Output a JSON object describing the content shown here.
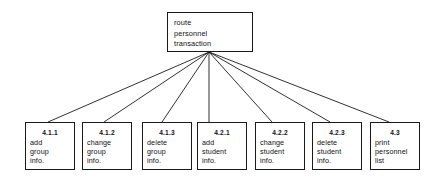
{
  "diagram": {
    "type": "structure-chart",
    "background_color": "#ffffff",
    "line_color": "#1a1a1a",
    "text_color": "#111111",
    "root": {
      "id": "",
      "lines": [
        "route",
        "personnel",
        "transaction"
      ]
    },
    "children": [
      {
        "id": "4.1.1",
        "lines": [
          "add",
          "group",
          "info."
        ]
      },
      {
        "id": "4.1.2",
        "lines": [
          "change",
          "group",
          "info."
        ]
      },
      {
        "id": "4.1.3",
        "lines": [
          "delete",
          "group",
          "info."
        ]
      },
      {
        "id": "4.2.1",
        "lines": [
          "add",
          "student",
          "info."
        ]
      },
      {
        "id": "4.2.2",
        "lines": [
          "change",
          "student",
          "info."
        ]
      },
      {
        "id": "4.2.3",
        "lines": [
          "delete",
          "student",
          "info."
        ]
      },
      {
        "id": "4.3",
        "lines": [
          "print",
          "personnel",
          "list"
        ]
      }
    ],
    "edges": {
      "from_point": {
        "x": 209,
        "y": 52
      },
      "to_points": [
        {
          "x": 48,
          "y": 122
        },
        {
          "x": 104,
          "y": 122
        },
        {
          "x": 162,
          "y": 122
        },
        {
          "x": 209,
          "y": 122
        },
        {
          "x": 272,
          "y": 122
        },
        {
          "x": 330,
          "y": 122
        },
        {
          "x": 389,
          "y": 122
        }
      ]
    },
    "geometry": {
      "root_box": {
        "x": 167,
        "y": 12,
        "w": 86,
        "h": 40
      },
      "child_boxes": [
        {
          "x": 25,
          "y": 122,
          "w": 50,
          "h": 48
        },
        {
          "x": 82,
          "y": 122,
          "w": 50,
          "h": 48
        },
        {
          "x": 142,
          "y": 122,
          "w": 50,
          "h": 48
        },
        {
          "x": 197,
          "y": 122,
          "w": 50,
          "h": 48
        },
        {
          "x": 255,
          "y": 122,
          "w": 50,
          "h": 48
        },
        {
          "x": 312,
          "y": 122,
          "w": 50,
          "h": 48
        },
        {
          "x": 370,
          "y": 122,
          "w": 50,
          "h": 48
        }
      ]
    }
  }
}
